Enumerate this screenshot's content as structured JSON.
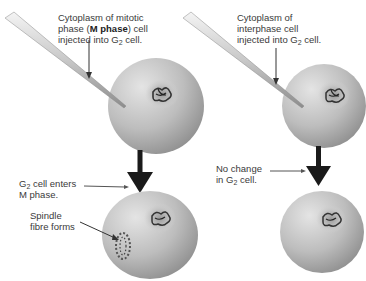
{
  "top_cut_text": "",
  "left": {
    "injection_label": {
      "line1": "Cytoplasm of mitotic",
      "line2_pre": "phase (",
      "line2_bold": "M phase",
      "line2_post": ") cell",
      "line3_pre": "injected into G",
      "line3_sub": "2",
      "line3_post": " cell."
    },
    "result_label": {
      "line1_pre": "G",
      "line1_sub": "2",
      "line1_post": " cell enters",
      "line2": "M phase."
    },
    "spindle_label": {
      "line1": "Spindle",
      "line2": "fibre forms"
    }
  },
  "right": {
    "injection_label": {
      "line1": "Cytoplasm of",
      "line2": "interphase cell",
      "line3_pre": "injected into G",
      "line3_sub": "2",
      "line3_post": " cell."
    },
    "result_label": {
      "line1": "No change",
      "line2_pre": "in G",
      "line2_sub": "2",
      "line2_post": " cell."
    }
  },
  "colors": {
    "cell": "#b8b8b8",
    "cell_light": "#e2e2e2",
    "cell_dark": "#8e8e8e",
    "arrow": "#1a1a1a",
    "text": "#3a3a3a"
  }
}
